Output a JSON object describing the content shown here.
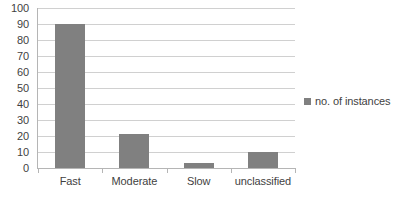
{
  "chart_data": {
    "type": "bar",
    "title": "",
    "xlabel": "",
    "ylabel": "",
    "categories": [
      "Fast",
      "Moderate",
      "Slow",
      "unclassified"
    ],
    "values": [
      90,
      21,
      3,
      10
    ],
    "series": [
      {
        "name": "no. of instances",
        "values": [
          90,
          21,
          3,
          10
        ]
      }
    ],
    "ylim": [
      0,
      100
    ],
    "ytick_step": 10,
    "yticks": [
      100,
      90,
      80,
      70,
      60,
      50,
      40,
      30,
      20,
      10,
      0
    ],
    "grid": "horizontal",
    "legend_position": "right",
    "bar_color": "#808080",
    "gridline_color": "#d0d0d0",
    "axis_color": "#b5b5b5",
    "text_color": "#3f3f3f"
  },
  "legend": {
    "entries": [
      {
        "label": "no. of instances",
        "color": "#808080"
      }
    ]
  },
  "caption": {
    "clipped_text": ""
  }
}
